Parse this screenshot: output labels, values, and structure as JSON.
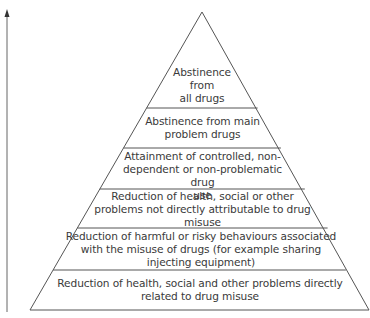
{
  "diagram": {
    "type": "pyramid",
    "arrow": {
      "direction": "up",
      "label": ""
    },
    "tiers": [
      {
        "label": "Abstinence\nfrom\nall drugs"
      },
      {
        "label": "Abstinence from main\nproblem drugs"
      },
      {
        "label": "Attainment of controlled, non-\ndependent or non-problematic drug\nuse"
      },
      {
        "label": "Reduction of health, social or other\nproblems not directly attributable to drug\nmisuse"
      },
      {
        "label": "Reduction of harmful or risky behaviours associated\nwith the misuse of drugs (for example sharing\ninjecting equipment)"
      },
      {
        "label": "Reduction of health, social and other problems directly\nrelated to drug misuse"
      }
    ],
    "colors": {
      "line": "#555555",
      "text": "#3a3a3a",
      "background": "#ffffff"
    }
  }
}
